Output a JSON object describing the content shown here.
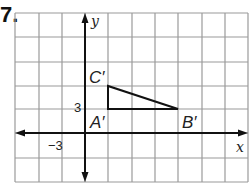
{
  "problem": {
    "number": "7."
  },
  "graph": {
    "x_axis_label": "x",
    "y_axis_label": "y",
    "grid_unit": 3,
    "x_range": [
      -9,
      21
    ],
    "y_range": [
      -6,
      15
    ],
    "tick_labels": {
      "x_neg": "−3",
      "y_pos": "3"
    },
    "colors": {
      "grid": "#9a9a9a",
      "axis": "#111111",
      "shape": "#111111"
    }
  },
  "triangle": {
    "vertices": [
      {
        "label": "A′",
        "x": 3,
        "y": 3
      },
      {
        "label": "B′",
        "x": 12,
        "y": 3
      },
      {
        "label": "C′",
        "x": 3,
        "y": 6
      }
    ]
  }
}
